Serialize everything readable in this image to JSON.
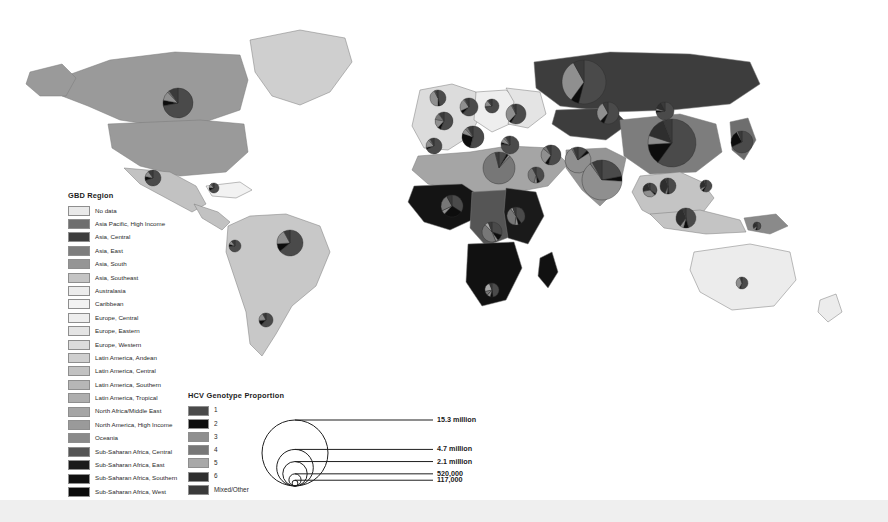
{
  "figure": {
    "type": "choropleth-map-with-proportional-pies"
  },
  "gbd_legend": {
    "title": "GBD Region",
    "items": [
      {
        "label": "No data",
        "color": "#e9e9e9"
      },
      {
        "label": "Asia Pacific, High Income",
        "color": "#6e6e6e"
      },
      {
        "label": "Asia, Central",
        "color": "#3d3d3d"
      },
      {
        "label": "Asia, East",
        "color": "#7d7d7d"
      },
      {
        "label": "Asia, South",
        "color": "#959595"
      },
      {
        "label": "Asia, Southeast",
        "color": "#c4c4c4"
      },
      {
        "label": "Australasia",
        "color": "#ececec"
      },
      {
        "label": "Caribbean",
        "color": "#f2f2f2"
      },
      {
        "label": "Europe, Central",
        "color": "#eeeeee"
      },
      {
        "label": "Europe, Eastern",
        "color": "#e4e4e4"
      },
      {
        "label": "Europe, Western",
        "color": "#dcdcdc"
      },
      {
        "label": "Latin America, Andean",
        "color": "#cfcfcf"
      },
      {
        "label": "Latin America, Central",
        "color": "#c2c2c2"
      },
      {
        "label": "Latin America, Southern",
        "color": "#b6b6b6"
      },
      {
        "label": "Latin America, Tropical",
        "color": "#aeaeae"
      },
      {
        "label": "North Africa/Middle East",
        "color": "#a5a5a5"
      },
      {
        "label": "North America, High Income",
        "color": "#9a9a9a"
      },
      {
        "label": "Oceania",
        "color": "#8a8a8a"
      },
      {
        "label": "Sub-Saharan Africa, Central",
        "color": "#555555"
      },
      {
        "label": "Sub-Saharan Africa, East",
        "color": "#1a1a1a"
      },
      {
        "label": "Sub-Saharan Africa, Southern",
        "color": "#111111"
      },
      {
        "label": "Sub-Saharan Africa, West",
        "color": "#0a0a0a"
      }
    ]
  },
  "hcv_legend": {
    "title": "HCV Genotype Proportion",
    "items": [
      {
        "label": "1",
        "color": "#4a4a4a"
      },
      {
        "label": "2",
        "color": "#0d0d0d"
      },
      {
        "label": "3",
        "color": "#8f8f8f"
      },
      {
        "label": "4",
        "color": "#777777"
      },
      {
        "label": "5",
        "color": "#a8a8a8"
      },
      {
        "label": "6",
        "color": "#2e2e2e"
      },
      {
        "label": "Mixed/Other",
        "color": "#3a3a3a"
      }
    ]
  },
  "size_legend": {
    "title": "",
    "items": [
      {
        "label": "15.3 million",
        "value": 15300000
      },
      {
        "label": "4.7 million",
        "value": 4700000
      },
      {
        "label": "2.1 million",
        "value": 2100000
      },
      {
        "label": "520,000",
        "value": 520000
      },
      {
        "label": "117,000",
        "value": 117000
      }
    ]
  },
  "chart_data": {
    "type": "map",
    "title": "",
    "pies": [
      {
        "name": "United States",
        "x": 178,
        "y": 103,
        "r": 15,
        "slices": [
          72,
          6,
          10,
          2,
          0,
          0,
          10
        ]
      },
      {
        "name": "Mexico",
        "x": 153,
        "y": 178,
        "r": 8,
        "slices": [
          70,
          8,
          12,
          0,
          0,
          0,
          10
        ]
      },
      {
        "name": "Caribbean",
        "x": 214,
        "y": 188,
        "r": 5,
        "slices": [
          66,
          10,
          12,
          4,
          0,
          0,
          8
        ]
      },
      {
        "name": "Colombia",
        "x": 235,
        "y": 246,
        "r": 6,
        "slices": [
          74,
          6,
          10,
          0,
          0,
          0,
          10
        ]
      },
      {
        "name": "Brazil",
        "x": 290,
        "y": 243,
        "r": 13,
        "slices": [
          64,
          10,
          18,
          0,
          0,
          0,
          8
        ]
      },
      {
        "name": "Argentina",
        "x": 266,
        "y": 320,
        "r": 7,
        "slices": [
          62,
          12,
          18,
          0,
          0,
          0,
          8
        ]
      },
      {
        "name": "United Kingdom",
        "x": 438,
        "y": 98,
        "r": 8,
        "slices": [
          46,
          4,
          42,
          2,
          0,
          0,
          6
        ]
      },
      {
        "name": "France",
        "x": 444,
        "y": 121,
        "r": 9,
        "slices": [
          56,
          6,
          16,
          12,
          0,
          0,
          10
        ]
      },
      {
        "name": "Germany",
        "x": 469,
        "y": 107,
        "r": 9,
        "slices": [
          62,
          6,
          22,
          2,
          0,
          0,
          8
        ]
      },
      {
        "name": "Italy",
        "x": 473,
        "y": 137,
        "r": 11,
        "slices": [
          54,
          26,
          8,
          4,
          0,
          0,
          8
        ]
      },
      {
        "name": "Spain",
        "x": 434,
        "y": 146,
        "r": 8,
        "slices": [
          68,
          4,
          16,
          4,
          0,
          0,
          8
        ]
      },
      {
        "name": "Poland",
        "x": 492,
        "y": 106,
        "r": 7,
        "slices": [
          72,
          2,
          14,
          2,
          0,
          0,
          10
        ]
      },
      {
        "name": "Russia",
        "x": 584,
        "y": 82,
        "r": 22,
        "slices": [
          54,
          6,
          32,
          0,
          0,
          0,
          8
        ]
      },
      {
        "name": "Ukraine",
        "x": 516,
        "y": 114,
        "r": 10,
        "slices": [
          58,
          4,
          30,
          2,
          0,
          0,
          6
        ]
      },
      {
        "name": "Turkey",
        "x": 510,
        "y": 145,
        "r": 9,
        "slices": [
          76,
          4,
          8,
          4,
          0,
          0,
          8
        ]
      },
      {
        "name": "Egypt",
        "x": 499,
        "y": 168,
        "r": 16,
        "slices": [
          8,
          2,
          2,
          84,
          0,
          0,
          4
        ]
      },
      {
        "name": "Nigeria",
        "x": 452,
        "y": 206,
        "r": 11,
        "slices": [
          34,
          28,
          6,
          24,
          0,
          0,
          8
        ]
      },
      {
        "name": "Ethiopia",
        "x": 516,
        "y": 216,
        "r": 9,
        "slices": [
          40,
          6,
          6,
          38,
          4,
          0,
          6
        ]
      },
      {
        "name": "DR Congo",
        "x": 492,
        "y": 232,
        "r": 10,
        "slices": [
          30,
          10,
          4,
          44,
          6,
          0,
          6
        ]
      },
      {
        "name": "South Africa",
        "x": 492,
        "y": 290,
        "r": 7,
        "slices": [
          48,
          6,
          8,
          10,
          22,
          0,
          6
        ]
      },
      {
        "name": "Saudi Arabia",
        "x": 536,
        "y": 175,
        "r": 8,
        "slices": [
          42,
          6,
          6,
          38,
          0,
          0,
          8
        ]
      },
      {
        "name": "Iran",
        "x": 551,
        "y": 155,
        "r": 10,
        "slices": [
          54,
          6,
          26,
          6,
          0,
          0,
          8
        ]
      },
      {
        "name": "Pakistan",
        "x": 578,
        "y": 160,
        "r": 13,
        "slices": [
          12,
          4,
          76,
          2,
          0,
          0,
          6
        ]
      },
      {
        "name": "India",
        "x": 602,
        "y": 180,
        "r": 20,
        "slices": [
          22,
          4,
          64,
          2,
          0,
          0,
          8
        ]
      },
      {
        "name": "China",
        "x": 672,
        "y": 143,
        "r": 24,
        "slices": [
          60,
          14,
          6,
          0,
          0,
          14,
          6
        ]
      },
      {
        "name": "Japan",
        "x": 742,
        "y": 142,
        "r": 11,
        "slices": [
          68,
          24,
          2,
          0,
          0,
          0,
          6
        ]
      },
      {
        "name": "Mongolia",
        "x": 665,
        "y": 111,
        "r": 9,
        "slices": [
          72,
          4,
          4,
          0,
          0,
          12,
          8
        ]
      },
      {
        "name": "Kazakhstan",
        "x": 608,
        "y": 113,
        "r": 11,
        "slices": [
          56,
          6,
          30,
          0,
          0,
          0,
          8
        ]
      },
      {
        "name": "Indonesia",
        "x": 686,
        "y": 218,
        "r": 10,
        "slices": [
          46,
          8,
          6,
          0,
          0,
          34,
          6
        ]
      },
      {
        "name": "Vietnam",
        "x": 668,
        "y": 186,
        "r": 8,
        "slices": [
          48,
          4,
          4,
          0,
          0,
          38,
          6
        ]
      },
      {
        "name": "Thailand",
        "x": 650,
        "y": 190,
        "r": 7,
        "slices": [
          34,
          4,
          34,
          0,
          0,
          22,
          6
        ]
      },
      {
        "name": "Philippines",
        "x": 706,
        "y": 186,
        "r": 6,
        "slices": [
          56,
          6,
          6,
          0,
          0,
          26,
          6
        ]
      },
      {
        "name": "Australia",
        "x": 742,
        "y": 283,
        "r": 6,
        "slices": [
          54,
          4,
          36,
          0,
          0,
          0,
          6
        ]
      },
      {
        "name": "Papua New Guinea",
        "x": 757,
        "y": 226,
        "r": 4,
        "slices": [
          50,
          6,
          10,
          0,
          0,
          26,
          8
        ]
      }
    ]
  }
}
